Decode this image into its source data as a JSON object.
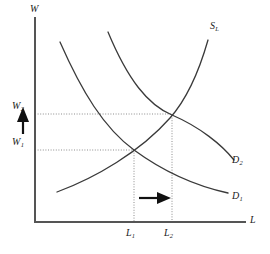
{
  "figure": {
    "background_color": "#ffffff",
    "axis_color": "#555555",
    "curve_color": "#3a3a3a",
    "guide_color": "#8d8d8d",
    "arrow_color": "#111111"
  },
  "axes": {
    "y_axis_label": "W",
    "x_axis_label": "L",
    "origin": {
      "x": 35,
      "y": 222
    },
    "y_top": 18,
    "x_right": 245
  },
  "curves": [
    {
      "id": "supply",
      "label_text": "S",
      "label_sub": "L",
      "label_full": "SL",
      "label_x": 210,
      "label_y": 21,
      "direction": "upward-sloping",
      "path": "M 57 192 C 95 178, 140 152, 170 118 C 186 100, 198 75, 208 40"
    },
    {
      "id": "demand-1",
      "label_text": "D",
      "label_sub": "1",
      "label_full": "D1",
      "label_x": 232,
      "label_y": 191,
      "direction": "downward-sloping",
      "path": "M 60 42 C 82 92, 104 128, 134 150 C 164 172, 196 186, 228 193"
    },
    {
      "id": "demand-2",
      "label_text": "D",
      "label_sub": "2",
      "label_full": "D2",
      "label_x": 232,
      "label_y": 155,
      "direction": "downward-sloping",
      "path": "M 108 32 C 128 80, 148 105, 172 115 C 200 127, 222 145, 234 160"
    }
  ],
  "equilibria": [
    {
      "id": "e1",
      "x": 134,
      "y": 150,
      "wage_label": "W1",
      "labor_label": "L1"
    },
    {
      "id": "e2",
      "x": 172,
      "y": 115,
      "wage_label": "W2",
      "labor_label": "L2"
    }
  ],
  "wage_labels": [
    {
      "text": "W",
      "sub": "2",
      "full": "W2",
      "x": 12,
      "y": 101,
      "guide_y": 114
    },
    {
      "text": "W",
      "sub": "1",
      "full": "W1",
      "x": 12,
      "y": 137,
      "guide_y": 150
    }
  ],
  "labor_labels": [
    {
      "text": "L",
      "sub": "1",
      "full": "L1",
      "x": 126,
      "y": 228,
      "guide_x": 134
    },
    {
      "text": "L",
      "sub": "2",
      "full": "L2",
      "x": 164,
      "y": 228,
      "guide_x": 172
    }
  ],
  "guides": [
    {
      "id": "wage-guide-2",
      "orientation": "horizontal",
      "from_x": 35,
      "to_x": 172,
      "y": 114
    },
    {
      "id": "wage-guide-1",
      "orientation": "horizontal",
      "from_x": 35,
      "to_x": 134,
      "y": 150
    },
    {
      "id": "labor-guide-1",
      "orientation": "vertical",
      "x": 134,
      "from_y": 150,
      "to_y": 222
    },
    {
      "id": "labor-guide-2",
      "orientation": "vertical",
      "x": 172,
      "from_y": 115,
      "to_y": 222
    }
  ],
  "arrows": [
    {
      "id": "wage-increase-arrow",
      "direction": "up",
      "meaning": "wage rises from W1 to W2",
      "shaft": {
        "x1": 23,
        "y1": 134,
        "x2": 23,
        "y2": 117
      },
      "head_points": "23,108 29,122 17,122"
    },
    {
      "id": "labor-demand-shift-arrow",
      "direction": "right",
      "meaning": "labor demand shifts right from D1 to D2",
      "shaft": {
        "x1": 139,
        "y1": 198,
        "x2": 162,
        "y2": 198
      },
      "head_points": "170,198 158,204 158,192"
    }
  ]
}
